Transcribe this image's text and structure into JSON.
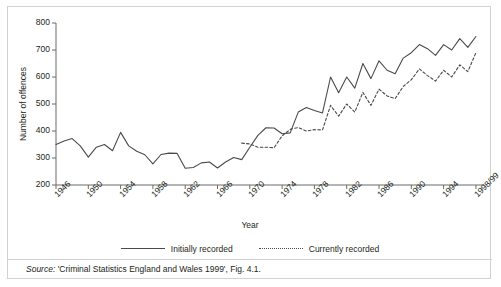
{
  "figure": {
    "source_prefix": "Source:",
    "source_text": " 'Criminal Statistics England and Wales 1999', Fig. 4.1."
  },
  "legend": {
    "entries": [
      {
        "label": "Initially recorded",
        "style": "solid"
      },
      {
        "label": "Currently recorded",
        "style": "dotted"
      }
    ]
  },
  "chart_data": {
    "type": "line",
    "title": "",
    "xlabel": "Year",
    "ylabel": "Number of offences",
    "ylim": [
      200,
      800
    ],
    "ytick_values": [
      200,
      300,
      400,
      500,
      600,
      700,
      800
    ],
    "ytick_labels": [
      "200",
      "300",
      "400",
      "500",
      "600",
      "700",
      "800"
    ],
    "xlim": [
      1946,
      1999
    ],
    "xtick_values": [
      1946,
      1950,
      1954,
      1958,
      1962,
      1966,
      1970,
      1974,
      1978,
      1982,
      1986,
      1990,
      1994,
      1998
    ],
    "xtick_labels": [
      "1946",
      "1950",
      "1954",
      "1958",
      "1962",
      "1966",
      "1970",
      "1974",
      "1978",
      "1982",
      "1986",
      "1990",
      "1994",
      "1998/99"
    ],
    "grid": false,
    "legend_position": "below",
    "units": "thousands of offences",
    "series": [
      {
        "name": "Initially recorded",
        "style": "solid",
        "color": "#4a4a4a",
        "x": [
          1946,
          1947,
          1948,
          1949,
          1950,
          1951,
          1952,
          1953,
          1954,
          1955,
          1956,
          1957,
          1958,
          1959,
          1960,
          1961,
          1962,
          1963,
          1964,
          1965,
          1966,
          1967,
          1968,
          1969,
          1970,
          1971,
          1972,
          1973,
          1974,
          1975,
          1976,
          1977,
          1978,
          1979,
          1980,
          1981,
          1982,
          1983,
          1984,
          1985,
          1986,
          1987,
          1988,
          1989,
          1990,
          1991,
          1992,
          1993,
          1994,
          1995,
          1996,
          1997,
          1998
        ],
        "values": [
          350,
          363,
          372,
          345,
          303,
          340,
          350,
          327,
          395,
          345,
          325,
          312,
          278,
          313,
          318,
          317,
          262,
          265,
          282,
          285,
          263,
          285,
          302,
          294,
          340,
          384,
          412,
          411,
          390,
          393,
          470,
          487,
          476,
          467,
          600,
          542,
          600,
          559,
          650,
          594,
          660,
          625,
          612,
          670,
          690,
          720,
          705,
          680,
          720,
          700,
          742,
          710,
          750
        ],
        "note": "Solid line runs the full period 1946-1998/99"
      },
      {
        "name": "Currently recorded",
        "style": "dotted",
        "color": "#4a4a4a",
        "x": [
          1969,
          1970,
          1971,
          1972,
          1973,
          1974,
          1975,
          1976,
          1977,
          1978,
          1979,
          1980,
          1981,
          1982,
          1983,
          1984,
          1985,
          1986,
          1987,
          1988,
          1989,
          1990,
          1991,
          1992,
          1993,
          1994,
          1995,
          1996,
          1997,
          1998
        ],
        "values": [
          355,
          352,
          340,
          340,
          338,
          382,
          406,
          413,
          400,
          405,
          404,
          495,
          455,
          500,
          470,
          543,
          495,
          555,
          530,
          520,
          565,
          590,
          630,
          605,
          585,
          625,
          600,
          645,
          620,
          690
        ],
        "note": "Dotted line begins in 1969 and tracks below the solid line"
      }
    ]
  }
}
